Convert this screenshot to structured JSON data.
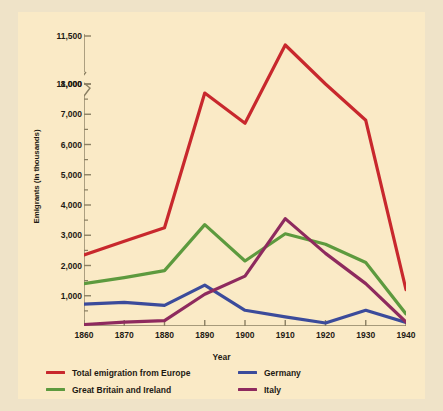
{
  "chart_data": {
    "type": "line",
    "title": "",
    "xlabel": "Year",
    "ylabel": "Emigrants (in thousands)",
    "x": [
      1860,
      1870,
      1880,
      1890,
      1900,
      1910,
      1920,
      1930,
      1940
    ],
    "xtick_labels": [
      "1860",
      "1870",
      "1880",
      "1890",
      "1900",
      "1910",
      "1920",
      "1930",
      "1940"
    ],
    "ytick_labels": [
      "1,000",
      "2,000",
      "3,000",
      "4,000",
      "5,000",
      "6,000",
      "7,000",
      "8,000",
      "11,000",
      "11,500"
    ],
    "ytick_values": [
      1000,
      2000,
      3000,
      4000,
      5000,
      6000,
      7000,
      8000,
      11000,
      11500
    ],
    "ylim": [
      0,
      11500
    ],
    "axis_break": {
      "present": true,
      "between": [
        8000,
        11000
      ],
      "note": "zigzag break on y-axis between 8,000 and 11,000"
    },
    "grid": false,
    "legend_position": "below",
    "series": [
      {
        "name": "Total emigration from Europe",
        "color": "#c8282d",
        "values": [
          2350,
          2800,
          3250,
          7700,
          6700,
          11250,
          9000,
          6800,
          1200
        ]
      },
      {
        "name": "Great Britain and Ireland",
        "color": "#5d9a3e",
        "values": [
          1400,
          1600,
          1830,
          3350,
          2150,
          3050,
          2700,
          2100,
          400
        ]
      },
      {
        "name": "Germany",
        "color": "#3b4b9b",
        "values": [
          720,
          780,
          680,
          1350,
          520,
          300,
          100,
          520,
          120
        ]
      },
      {
        "name": "Italy",
        "color": "#8e2a5e",
        "values": [
          50,
          130,
          180,
          1050,
          1650,
          3550,
          2400,
          1400,
          130
        ]
      }
    ]
  },
  "axes": {
    "xlabel": "Year",
    "ylabel": "Emigrants (in thousands)"
  },
  "legend": {
    "items": [
      {
        "label": "Total emigration from Europe",
        "color": "#c8282d"
      },
      {
        "label": "Germany",
        "color": "#3b4b9b"
      },
      {
        "label": "Great Britain and Ireland",
        "color": "#5d9a3e"
      },
      {
        "label": "Italy",
        "color": "#8e2a5e"
      }
    ]
  },
  "colors": {
    "background": "#faeac6",
    "page": "#efe3c8",
    "axis": "#8a7f62",
    "text": "#1e1a14"
  }
}
